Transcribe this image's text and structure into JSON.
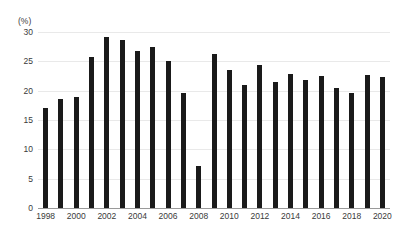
{
  "chart_data": {
    "type": "bar",
    "title": "",
    "subtitle": "",
    "xlabel": "",
    "ylabel": "(%)",
    "y_unit_label": "(%)",
    "ylim": [
      0,
      30
    ],
    "yticks": [
      0,
      5,
      10,
      15,
      20,
      25,
      30
    ],
    "ytick_labels": [
      "0",
      "5",
      "10",
      "15",
      "20",
      "25",
      "30"
    ],
    "grid": true,
    "grid_axis": "y",
    "legend": false,
    "legend_position": "none",
    "bar_color": "#1a1a1a",
    "categories": [
      "1998",
      "1999",
      "2000",
      "2001",
      "2002",
      "2003",
      "2004",
      "2005",
      "2006",
      "2007",
      "2008",
      "2009",
      "2010",
      "2011",
      "2012",
      "2013",
      "2014",
      "2015",
      "2016",
      "2017",
      "2018",
      "2019",
      "2020"
    ],
    "values": [
      17.1,
      18.6,
      19.0,
      25.7,
      29.1,
      28.7,
      26.8,
      27.5,
      25.1,
      19.6,
      7.2,
      26.2,
      23.6,
      20.9,
      24.3,
      21.5,
      22.9,
      21.8,
      22.5,
      20.5,
      19.6,
      22.6,
      22.4
    ],
    "xtick_labels": [
      "1998",
      "2000",
      "2002",
      "2004",
      "2006",
      "2008",
      "2010",
      "2012",
      "2014",
      "2016",
      "2018",
      "2020"
    ],
    "xtick_categories": [
      "1998",
      "2000",
      "2002",
      "2004",
      "2006",
      "2008",
      "2010",
      "2012",
      "2014",
      "2016",
      "2018",
      "2020"
    ]
  }
}
